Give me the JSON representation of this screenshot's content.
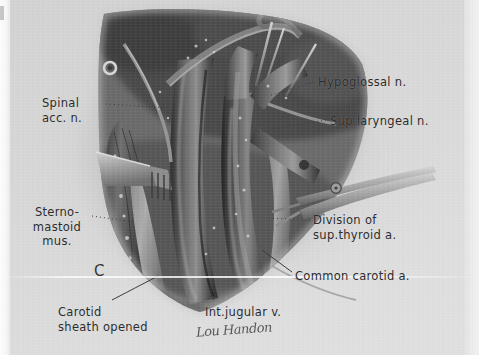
{
  "plate": {
    "figure_letter": "C",
    "signature": "Lou Handon",
    "background_color": "#d8d8d8",
    "ink_color": "#2b2b2b"
  },
  "labels": [
    {
      "name": "label-spinal-accessory-nerve",
      "lines": [
        "Spinal",
        "acc. n."
      ],
      "x": 42,
      "y": 96,
      "align": "left",
      "leader": "dash"
    },
    {
      "name": "label-hypoglossal-nerve",
      "lines": [
        "Hypoglossal n."
      ],
      "x": 318,
      "y": 75,
      "align": "left",
      "leader": "dot"
    },
    {
      "name": "label-superior-laryngeal-nerve",
      "lines": [
        "Sup.laryngeal n."
      ],
      "x": 330,
      "y": 114,
      "align": "left",
      "leader": "dot"
    },
    {
      "name": "label-sternomastoid-muscle",
      "lines": [
        "Sterno-",
        "mastoid",
        "mus."
      ],
      "x": 25,
      "y": 205,
      "align": "center",
      "leader": "dash"
    },
    {
      "name": "label-division-superior-thyroid-artery",
      "lines": [
        "Division of",
        "sup.thyroid a."
      ],
      "x": 313,
      "y": 213,
      "align": "left",
      "leader": "dot"
    },
    {
      "name": "label-common-carotid-artery",
      "lines": [
        "Common carotid a."
      ],
      "x": 295,
      "y": 269,
      "align": "left",
      "leader": "line"
    },
    {
      "name": "label-carotid-sheath-opened",
      "lines": [
        "Carotid",
        "sheath opened"
      ],
      "x": 58,
      "y": 305,
      "align": "left",
      "leader": "line"
    },
    {
      "name": "label-internal-jugular-vein",
      "lines": [
        "Int.jugular v."
      ],
      "x": 205,
      "y": 305,
      "align": "left",
      "leader": "dot"
    }
  ]
}
